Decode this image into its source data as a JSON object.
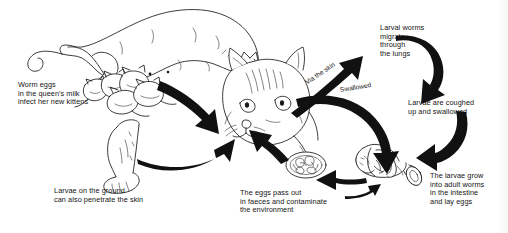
{
  "diagram": {
    "type": "life-cycle-flow-diagram",
    "background_color": "#ffffff",
    "ink_color": "#141414",
    "arrow_color": "#111111",
    "labels": {
      "queen_milk": "Worm eggs\nin the queen's milk\ninfect her new kittens",
      "ground_larvae": "Larvae on the ground\ncan also penetrate the skin",
      "faeces": "The eggs pass out\nin faeces and contaminate\nthe environment",
      "larval_worms": "Larval worms\nmigrate\nthrough\nthe lungs",
      "coughed": "Larvae are coughed\nup and swallowed",
      "adult_worms": "The larvae grow\ninto adult worms\nin the intestine\nand lay eggs",
      "via_skin": "Via the skin",
      "swallowed": "Swallowed"
    },
    "illustrations": [
      {
        "name": "queen-with-kittens",
        "description": "Lying queen cat nursing a litter of kittens"
      },
      {
        "name": "adult-cat-head",
        "description": "Head of adult cat facing left"
      },
      {
        "name": "cat-hind-leg-paw",
        "description": "Cat hind leg and paw on the ground"
      },
      {
        "name": "faeces-with-eggs",
        "description": "Oval mass of faeces containing worm eggs"
      },
      {
        "name": "intestine-cross-section",
        "description": "Cut open intestine segment containing adult worms"
      }
    ],
    "flow_steps": [
      {
        "from": "queen-with-kittens",
        "to": "adult-cat-head",
        "label": ""
      },
      {
        "from": "cat-hind-leg-paw",
        "to": "adult-cat-head",
        "label": ""
      },
      {
        "from": "adult-cat-head",
        "to": "lungs",
        "label": "Via the skin"
      },
      {
        "from": "adult-cat-head",
        "to": "intestine",
        "label": "Swallowed"
      },
      {
        "from": "lungs",
        "to": "coughed-up",
        "label": ""
      },
      {
        "from": "coughed-up",
        "to": "intestine-cross-section",
        "label": ""
      },
      {
        "from": "intestine-cross-section",
        "to": "faeces-with-eggs",
        "label": ""
      },
      {
        "from": "faeces-with-eggs",
        "to": "adult-cat-head",
        "label": ""
      }
    ]
  }
}
